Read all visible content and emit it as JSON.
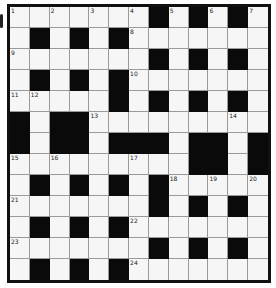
{
  "puzzle": {
    "type": "crossword",
    "rows": 13,
    "cols": 13,
    "layout": [
      "WWWWWWWBWBWBW",
      "WBWBWBWWWWWWW",
      "WWWWWWWBWBWBW",
      "WBWBWBWWWWWWW",
      "WWWWWBWBWBWBW",
      "BWBBWWWWWWWWW",
      "BWBBWBBBWBBWB",
      "WWWWWWWWWBBWB",
      "WBWBWBWBWWWWW",
      "WWWWWWWBWBWBW",
      "WBWBWBWWWWWWW",
      "WWWWWWWBWBWBW",
      "WBWBWBWWWWWWW"
    ],
    "numbers": [
      {
        "n": "1",
        "r": 0,
        "c": 0
      },
      {
        "n": "2",
        "r": 0,
        "c": 2
      },
      {
        "n": "3",
        "r": 0,
        "c": 4
      },
      {
        "n": "4",
        "r": 0,
        "c": 6
      },
      {
        "n": "5",
        "r": 0,
        "c": 8
      },
      {
        "n": "6",
        "r": 0,
        "c": 10
      },
      {
        "n": "7",
        "r": 0,
        "c": 12
      },
      {
        "n": "8",
        "r": 1,
        "c": 6
      },
      {
        "n": "9",
        "r": 2,
        "c": 0
      },
      {
        "n": "10",
        "r": 3,
        "c": 6
      },
      {
        "n": "11",
        "r": 4,
        "c": 0
      },
      {
        "n": "12",
        "r": 4,
        "c": 1
      },
      {
        "n": "13",
        "r": 5,
        "c": 4
      },
      {
        "n": "14",
        "r": 5,
        "c": 11
      },
      {
        "n": "15",
        "r": 7,
        "c": 0
      },
      {
        "n": "16",
        "r": 7,
        "c": 2
      },
      {
        "n": "17",
        "r": 7,
        "c": 6
      },
      {
        "n": "18",
        "r": 8,
        "c": 8
      },
      {
        "n": "19",
        "r": 8,
        "c": 10
      },
      {
        "n": "20",
        "r": 8,
        "c": 12
      },
      {
        "n": "21",
        "r": 9,
        "c": 0
      },
      {
        "n": "22",
        "r": 10,
        "c": 6
      },
      {
        "n": "23",
        "r": 11,
        "c": 0
      },
      {
        "n": "24",
        "r": 12,
        "c": 6
      }
    ],
    "colors": {
      "block": "#0a0a0a",
      "empty": "#f6f6f6",
      "gridline": "#9a9a9a",
      "border": "#111111"
    }
  }
}
